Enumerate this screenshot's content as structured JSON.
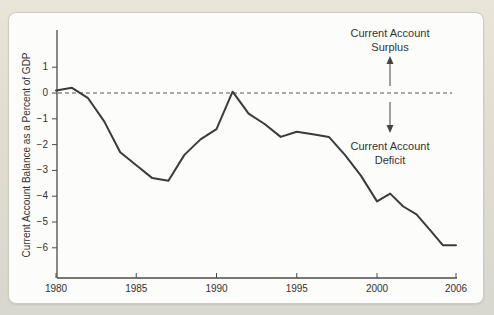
{
  "page": {
    "title_fragment": "Balance as a Percent of GDP"
  },
  "annotations": {
    "surplus": {
      "line1": "Current Account",
      "line2": "Surplus"
    },
    "deficit": {
      "line1": "Current Account",
      "line2": "Deficit"
    }
  },
  "colors": {
    "line": "#3b3b3b",
    "axis": "#4a4a4a",
    "dashed_zero_line": "#555555",
    "panel_background": "#fcfcfa",
    "page_background": "#e2ddd1",
    "text": "#333333"
  },
  "chart_data": {
    "type": "line",
    "title": "",
    "xlabel": "",
    "ylabel": "Current Account Balance as a Percent of GDP",
    "x": [
      1980,
      1981,
      1982,
      1983,
      1984,
      1985,
      1986,
      1987,
      1988,
      1989,
      1990,
      1991,
      1992,
      1993,
      1994,
      1995,
      1996,
      1997,
      1998,
      1999,
      2000,
      2001,
      2002,
      2003,
      2004,
      2005,
      2006
    ],
    "values": [
      0.1,
      0.2,
      -0.2,
      -1.1,
      -2.3,
      -2.8,
      -3.3,
      -3.4,
      -2.4,
      -1.8,
      -1.4,
      0.05,
      -0.8,
      -1.2,
      -1.7,
      -1.5,
      -1.6,
      -1.7,
      -2.4,
      -3.2,
      -4.2,
      -3.9,
      -4.4,
      -4.7,
      -5.3,
      -5.9,
      -5.9
    ],
    "series": [
      {
        "name": "Current account balance (% of GDP)"
      }
    ],
    "x_ticks": [
      {
        "year": 1980,
        "label": "1980"
      },
      {
        "year": 1985,
        "label": "1985"
      },
      {
        "year": 1990,
        "label": "1990"
      },
      {
        "year": 1995,
        "label": "1995"
      },
      {
        "year": 2000,
        "label": "2000"
      },
      {
        "year": 2006,
        "label": "2006"
      }
    ],
    "y_ticks": [
      {
        "value": 1,
        "label": "1"
      },
      {
        "value": 0,
        "label": "0"
      },
      {
        "value": -1,
        "label": "−1"
      },
      {
        "value": -2,
        "label": "−2"
      },
      {
        "value": -3,
        "label": "−3"
      },
      {
        "value": -4,
        "label": "−4"
      },
      {
        "value": -5,
        "label": "−5"
      },
      {
        "value": -6,
        "label": "−6"
      }
    ],
    "ylim": [
      -7,
      2.4
    ],
    "zero_line": "dashed",
    "grid": false,
    "legend": "none"
  }
}
